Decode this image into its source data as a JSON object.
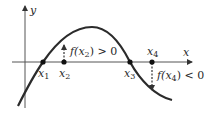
{
  "diagram": {
    "axes": {
      "x_label": "x",
      "y_label": "y"
    },
    "points": [
      {
        "id": "x1",
        "label_base": "x",
        "label_sub": "1",
        "role": "root"
      },
      {
        "id": "x2",
        "label_base": "x",
        "label_sub": "2",
        "role": "sample"
      },
      {
        "id": "x3",
        "label_base": "x",
        "label_sub": "3",
        "role": "root"
      },
      {
        "id": "x4",
        "label_base": "x",
        "label_sub": "4",
        "role": "sample"
      }
    ],
    "annotations": {
      "f_x2": {
        "func": "f(",
        "arg_base": "x",
        "arg_sub": "2",
        "close": ")",
        "relation": " > 0"
      },
      "f_x4": {
        "func": "f(",
        "arg_base": "x",
        "arg_sub": "4",
        "close": ")",
        "relation": " < 0"
      }
    },
    "colors": {
      "curve": "#2b2b2b",
      "axis": "#555555",
      "point": "#111111"
    }
  }
}
